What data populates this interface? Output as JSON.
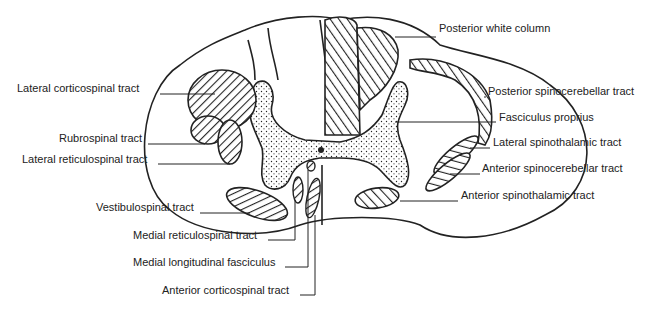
{
  "diagram": {
    "labels_left": [
      {
        "id": "lateral-corticospinal",
        "text": "Lateral corticospinal tract",
        "x": 17,
        "y": 88
      },
      {
        "id": "rubrospinal",
        "text": "Rubrospinal tract",
        "x": 59,
        "y": 138
      },
      {
        "id": "lateral-reticulospinal",
        "text": "Lateral reticulospinal tract",
        "x": 22,
        "y": 159
      },
      {
        "id": "vestibulospinal",
        "text": "Vestibulospinal tract",
        "x": 96,
        "y": 207
      }
    ],
    "labels_bottom": [
      {
        "id": "medial-reticulospinal",
        "text": "Medial reticulospinal tract",
        "x": 133,
        "y": 235
      },
      {
        "id": "medial-longitudinal-fasciculus",
        "text": "Medial longitudinal fasciculus",
        "x": 133,
        "y": 262
      },
      {
        "id": "anterior-corticospinal",
        "text": "Anterior corticospinal tract",
        "x": 162,
        "y": 290
      }
    ],
    "labels_right": [
      {
        "id": "posterior-white-column",
        "text": "Posterior white column",
        "x": 439,
        "y": 28
      },
      {
        "id": "posterior-spinocerebellar",
        "text": "Posterior spinocerebellar tract",
        "x": 488,
        "y": 91
      },
      {
        "id": "fasciculus-proprius",
        "text": "Fasciculus proprius",
        "x": 499,
        "y": 117
      },
      {
        "id": "lateral-spinothalamic",
        "text": "Lateral spinothalamic tract",
        "x": 493,
        "y": 142
      },
      {
        "id": "anterior-spinocerebellar",
        "text": "Anterior spinocerebellar tract",
        "x": 482,
        "y": 168
      },
      {
        "id": "anterior-spinothalamic",
        "text": "Anterior spinothalamic tract",
        "x": 461,
        "y": 195
      }
    ]
  }
}
